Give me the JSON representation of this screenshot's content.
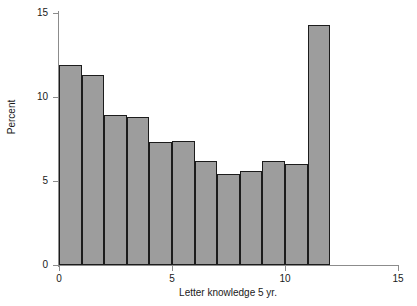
{
  "chart_data": {
    "type": "bar",
    "title": "",
    "xlabel": "Letter knowledge 5 yr.",
    "ylabel": "Percent",
    "xlim": [
      0,
      15
    ],
    "ylim": [
      0,
      15
    ],
    "xticks": [
      0,
      5,
      10,
      15
    ],
    "xtick_labels": [
      "0",
      "5",
      "10",
      "15"
    ],
    "yticks": [
      0,
      5,
      10,
      15
    ],
    "ytick_labels": [
      "0",
      "5",
      "10",
      "15"
    ],
    "grid": false,
    "legend": false,
    "bin_width": 1,
    "bar_fill_color": "#9d9d9d",
    "bar_edge_color": "#1c1c1c",
    "axis_color": "#8c8c8c",
    "categories": [
      "0-1",
      "1-2",
      "2-3",
      "3-4",
      "4-5",
      "5-6",
      "6-7",
      "7-8",
      "8-9",
      "9-10",
      "10-11",
      "11-12"
    ],
    "bin_starts": [
      0,
      1,
      2,
      3,
      4,
      5,
      6,
      7,
      8,
      9,
      10,
      11
    ],
    "values": [
      11.9,
      11.3,
      8.9,
      8.8,
      7.3,
      7.4,
      6.2,
      5.4,
      5.6,
      6.2,
      6.0,
      14.3
    ]
  }
}
